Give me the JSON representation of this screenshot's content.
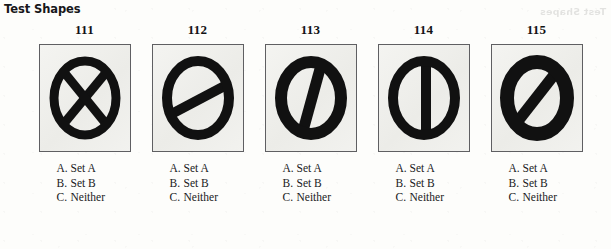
{
  "page": {
    "title": "Test Shapes",
    "watermark": "Test Shapes",
    "ink_color": "#111111",
    "panel_border_color": "#5f5f62",
    "panel_fill_color": "#f1f1ee",
    "paper_color": "#fdfdfb"
  },
  "options_template": [
    {
      "key": "A.",
      "label": "Set A"
    },
    {
      "key": "B.",
      "label": "Set B"
    },
    {
      "key": "C.",
      "label": "Neither"
    }
  ],
  "items": [
    {
      "number": "111",
      "shape_name": "circle-ring-with-x-cross",
      "shape_description": "Thick black circular ring containing an X made of two crossing diagonal bars",
      "options": [
        {
          "key": "A.",
          "label": "Set A"
        },
        {
          "key": "B.",
          "label": "Set B"
        },
        {
          "key": "C.",
          "label": "Neither"
        }
      ]
    },
    {
      "number": "112",
      "shape_name": "circle-ring-with-shallow-diagonal-bar",
      "shape_description": "Thick black circular ring crossed by a single shallow diagonal bar rising to the right",
      "options": [
        {
          "key": "A.",
          "label": "Set A"
        },
        {
          "key": "B.",
          "label": "Set B"
        },
        {
          "key": "C.",
          "label": "Neither"
        }
      ]
    },
    {
      "number": "113",
      "shape_name": "circle-ring-with-steep-diagonal-bar",
      "shape_description": "Very thick black circular ring crossed by a steep near-vertical tilted bar",
      "options": [
        {
          "key": "A.",
          "label": "Set A"
        },
        {
          "key": "B.",
          "label": "Set B"
        },
        {
          "key": "C.",
          "label": "Neither"
        }
      ]
    },
    {
      "number": "114",
      "shape_name": "circle-ring-with-vertical-bar",
      "shape_description": "Thick black circular ring crossed by a vertical bar through the center",
      "options": [
        {
          "key": "A.",
          "label": "Set A"
        },
        {
          "key": "B.",
          "label": "Set B"
        },
        {
          "key": "C.",
          "label": "Neither"
        }
      ]
    },
    {
      "number": "115",
      "shape_name": "circle-ring-with-45-degree-diagonal-bar",
      "shape_description": "Very thick black circular ring crossed by a 45 degree diagonal bar rising to the right",
      "options": [
        {
          "key": "A.",
          "label": "Set A"
        },
        {
          "key": "B.",
          "label": "Set B"
        },
        {
          "key": "C.",
          "label": "Neither"
        }
      ]
    }
  ]
}
